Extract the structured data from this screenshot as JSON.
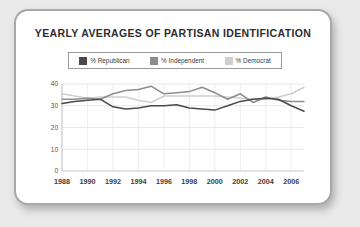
{
  "card": {
    "title": "YEARLY AVERAGES OF PARTISAN IDENTIFICATION"
  },
  "legend": {
    "items": [
      {
        "label": "% Republican",
        "color": "#4a4a4a"
      },
      {
        "label": "% Independent",
        "color": "#8d8d8d"
      },
      {
        "label": "% Democrat",
        "color": "#cfcfcf"
      }
    ]
  },
  "colors": {
    "republican": "#4a4a4a",
    "independent": "#8d8d8d",
    "democrat": "#cfcfcf",
    "grid": "#d6d6d6",
    "axis": "#b9b9b9",
    "card_border": "#a8a8a8",
    "page_background": "#e9e9e9",
    "title_text": "#2e2e2e"
  },
  "chart_data": {
    "type": "line",
    "title": "YEARLY AVERAGES OF PARTISAN IDENTIFICATION",
    "xlabel": "",
    "ylabel": "",
    "x": [
      1988,
      1989,
      1990,
      1991,
      1992,
      1993,
      1994,
      1995,
      1996,
      1997,
      1998,
      1999,
      2000,
      2001,
      2002,
      2003,
      2004,
      2005,
      2006,
      2007
    ],
    "xlim": [
      1988,
      2007
    ],
    "ylim": [
      0,
      40
    ],
    "yticks": [
      0,
      10,
      20,
      30,
      40
    ],
    "xticks": [
      1988,
      1990,
      1992,
      1994,
      1996,
      1998,
      2000,
      2002,
      2004,
      2006
    ],
    "xtick_labels": [
      "1988",
      "1990",
      "1992",
      "1994",
      "1996",
      "1998",
      "2000",
      "2002",
      "2004",
      "2006"
    ],
    "ytick_labels": [
      "0",
      "10",
      "20",
      "30",
      "40"
    ],
    "grid": true,
    "legend_position": "top",
    "series": [
      {
        "name": "% Republican",
        "color": "#4a4a4a",
        "values": [
          31.0,
          32.0,
          32.5,
          33.0,
          29.5,
          28.5,
          29.0,
          30.0,
          30.0,
          30.5,
          29.0,
          28.5,
          28.0,
          30.0,
          32.0,
          33.0,
          33.5,
          33.0,
          30.0,
          27.5
        ]
      },
      {
        "name": "% Independent",
        "color": "#8d8d8d",
        "values": [
          33.0,
          33.0,
          33.5,
          33.0,
          35.5,
          37.0,
          37.5,
          39.0,
          35.5,
          36.0,
          36.5,
          38.5,
          36.0,
          33.0,
          35.5,
          31.5,
          34.0,
          32.5,
          32.0,
          32.0
        ]
      },
      {
        "name": "% Democrat",
        "color": "#cfcfcf",
        "values": [
          35.5,
          34.5,
          33.5,
          34.0,
          34.0,
          34.0,
          32.5,
          31.5,
          34.5,
          34.5,
          34.5,
          34.5,
          34.5,
          34.0,
          33.5,
          33.0,
          33.0,
          34.0,
          35.5,
          38.5
        ]
      }
    ]
  }
}
